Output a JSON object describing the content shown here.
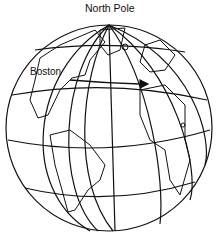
{
  "diagram": {
    "labels": {
      "north_pole": "North Pole",
      "boston": "Boston"
    },
    "colors": {
      "line": "#111111",
      "background": "#ffffff"
    }
  }
}
